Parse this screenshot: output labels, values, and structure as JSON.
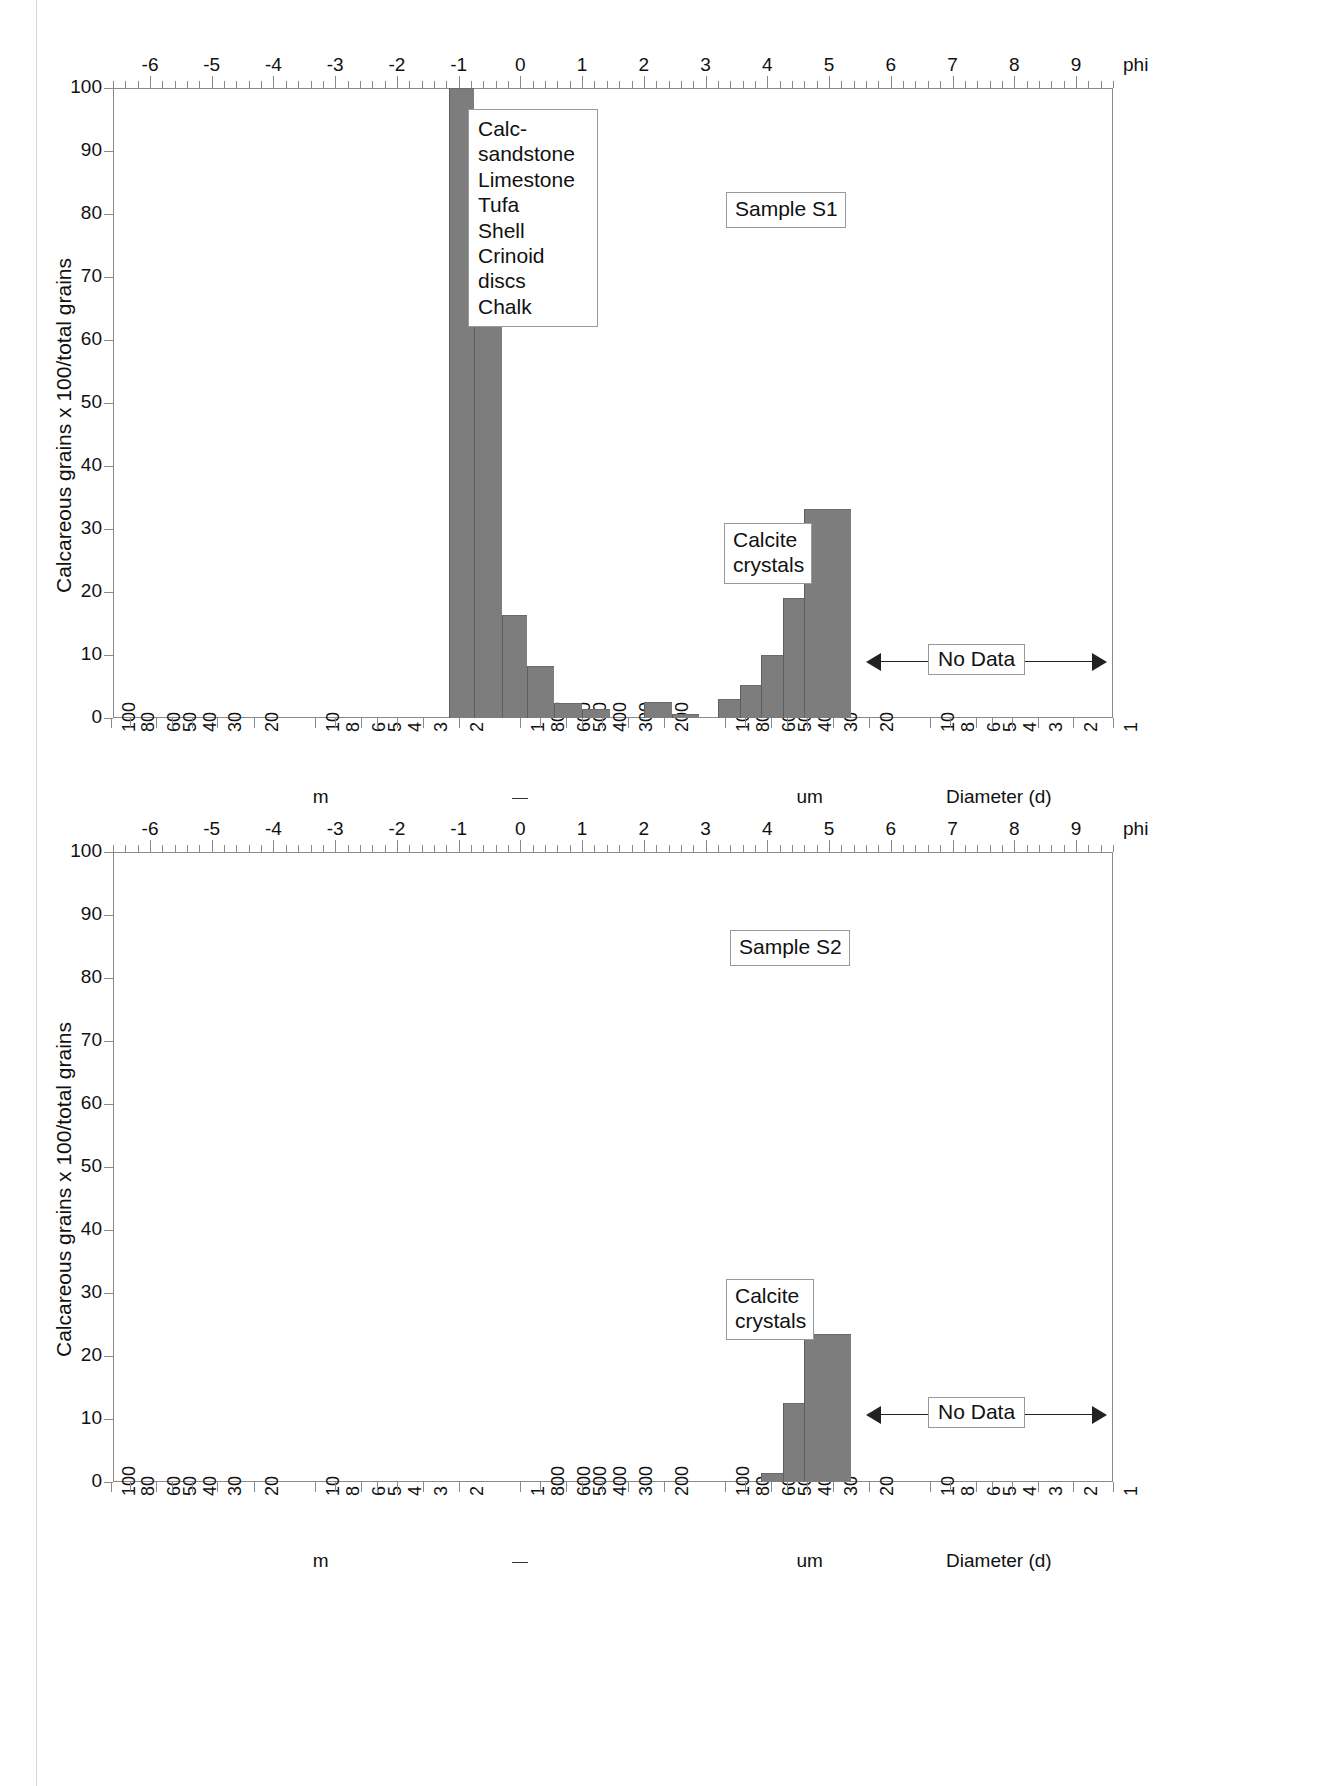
{
  "figure": {
    "ylabel": "Calcareous grains x 100/total grains",
    "phi_unit_label": "phi",
    "diameter_axis_label": "Diameter (d)",
    "unit_m": "m",
    "unit_um": "um",
    "phi_ticks": [
      "-6",
      "-5",
      "-4",
      "-3",
      "-2",
      "-1",
      "0",
      "1",
      "2",
      "3",
      "4",
      "5",
      "6",
      "7",
      "8",
      "9"
    ],
    "y_ticks": [
      "0",
      "10",
      "20",
      "30",
      "40",
      "50",
      "60",
      "70",
      "80",
      "90",
      "100"
    ],
    "diameter_ticks": [
      "100",
      "80",
      "60",
      "50",
      "40",
      "30",
      "20",
      "10",
      "8",
      "6",
      "5",
      "4",
      "3",
      "2",
      "1",
      "800",
      "600",
      "500",
      "400",
      "300",
      "200",
      "100",
      "80",
      "60",
      "50",
      "40",
      "30",
      "20",
      "10",
      "8",
      "6",
      "5",
      "4",
      "3",
      "2",
      "1"
    ],
    "no_data_label": "No Data",
    "legend_title": "",
    "legend_items": [
      "Calc-sandstone",
      "Limestone",
      "Tufa",
      "Shell",
      "Crinoid discs",
      "Chalk"
    ],
    "calcite_label_line1": "Calcite",
    "calcite_label_line2": "crystals"
  },
  "chart_data": [
    {
      "type": "bar",
      "title": "Sample S1",
      "xlabel": "Diameter (d)",
      "ylabel": "Calcareous grains x 100/total grains",
      "ylim": [
        0,
        100
      ],
      "xlim_phi": [
        -6.6,
        9.6
      ],
      "grid": false,
      "legend_position": "upper-left-inside",
      "x_axis_top": "phi",
      "x_axis_bottom": "grain diameter (mm / um)",
      "annotations": [
        "Calc-sandstone",
        "Limestone",
        "Tufa",
        "Shell",
        "Crinoid discs",
        "Chalk",
        "Calcite crystals",
        "No Data"
      ],
      "categories_phi": [
        -1.0,
        -0.5,
        0.0,
        0.5,
        1.0,
        1.5,
        2.0,
        2.5,
        3.0,
        3.5,
        4.0,
        4.25,
        4.5,
        4.75,
        5.0
      ],
      "bars": [
        {
          "phi_start": -1.15,
          "phi_end": -0.75,
          "value": 100.0,
          "label": "clasts -1 phi"
        },
        {
          "phi_start": -0.75,
          "phi_end": -0.3,
          "value": 66.2,
          "label": "clasts -0.75 phi"
        },
        {
          "phi_start": -0.3,
          "phi_end": 0.1,
          "value": 16.3,
          "label": "clasts -0.3 phi"
        },
        {
          "phi_start": 0.1,
          "phi_end": 0.55,
          "value": 8.2,
          "label": "clasts 0.1 phi"
        },
        {
          "phi_start": 0.55,
          "phi_end": 1.0,
          "value": 2.4,
          "label": "clasts 0.55 phi"
        },
        {
          "phi_start": 1.0,
          "phi_end": 1.45,
          "value": 1.5,
          "label": "clasts 1.0 phi"
        },
        {
          "phi_start": 2.0,
          "phi_end": 2.45,
          "value": 2.5,
          "label": "clasts 2.0 phi"
        },
        {
          "phi_start": 2.45,
          "phi_end": 2.9,
          "value": 0.7,
          "label": "clasts 2.45 phi"
        },
        {
          "phi_start": 3.2,
          "phi_end": 3.55,
          "value": 3.0,
          "label": "clasts 3.2 phi"
        },
        {
          "phi_start": 3.55,
          "phi_end": 3.9,
          "value": 5.2,
          "label": "clasts 3.55 phi"
        },
        {
          "phi_start": 3.9,
          "phi_end": 4.25,
          "value": 10.0,
          "label": "calcite 3.9 phi"
        },
        {
          "phi_start": 4.25,
          "phi_end": 4.6,
          "value": 19.0,
          "label": "calcite 4.25 phi"
        },
        {
          "phi_start": 4.6,
          "phi_end": 5.35,
          "value": 33.2,
          "label": "calcite 4.6 phi"
        }
      ],
      "no_data_range_phi": [
        5.6,
        9.5
      ]
    },
    {
      "type": "bar",
      "title": "Sample S2",
      "xlabel": "Diameter (d)",
      "ylabel": "Calcareous grains x 100/total grains",
      "ylim": [
        0,
        100
      ],
      "xlim_phi": [
        -6.6,
        9.6
      ],
      "grid": false,
      "legend_position": "none",
      "x_axis_top": "phi",
      "x_axis_bottom": "grain diameter (mm / um)",
      "annotations": [
        "Calcite crystals",
        "No Data"
      ],
      "bars": [
        {
          "phi_start": 3.9,
          "phi_end": 4.25,
          "value": 1.4,
          "label": "calcite 3.9 phi"
        },
        {
          "phi_start": 4.25,
          "phi_end": 4.6,
          "value": 12.5,
          "label": "calcite 4.25 phi"
        },
        {
          "phi_start": 4.6,
          "phi_end": 5.35,
          "value": 23.5,
          "label": "calcite 4.6 phi"
        }
      ],
      "no_data_range_phi": [
        5.6,
        9.5
      ]
    }
  ],
  "panels": [
    {
      "sample_label": "Sample S1"
    },
    {
      "sample_label": "Sample S2"
    }
  ]
}
